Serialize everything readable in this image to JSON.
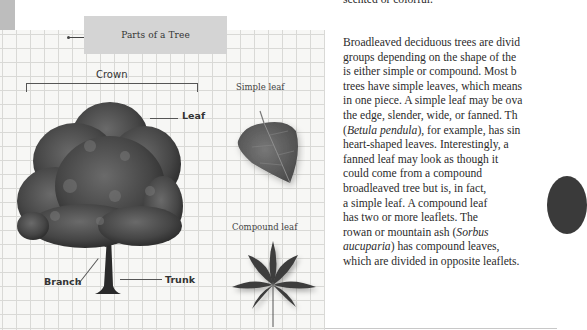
{
  "diagram": {
    "title": "Parts of a Tree",
    "labels": {
      "crown": "Crown",
      "leaf": "Leaf",
      "branch": "Branch",
      "trunk": "Trunk",
      "simple_leaf": "Simple leaf",
      "compound_leaf": "Compound leaf"
    },
    "icons": {
      "tree": "tree-illustration",
      "simple_leaf": "birch-leaf-image",
      "compound_leaf": "compound-leaf-image"
    }
  },
  "article": {
    "previous_line_fragment": "scented or colorful.",
    "paragraph_lines": [
      [
        {
          "t": "Broadleaved deciduous trees are divid"
        }
      ],
      [
        {
          "t": "groups depending on the shape of the"
        }
      ],
      [
        {
          "t": "is either simple or compound. Most b"
        }
      ],
      [
        {
          "t": "trees have simple leaves, which means"
        }
      ],
      [
        {
          "t": "in one piece. A simple leaf may be ova"
        }
      ],
      [
        {
          "t": "the edge, slender, wide, or fanned. Th"
        }
      ],
      [
        {
          "t": "(",
          "i": false
        },
        {
          "t": "Betula pendula",
          "i": true
        },
        {
          "t": "), for example, has sin",
          "i": false
        }
      ],
      [
        {
          "t": "heart-shaped leaves. Interestingly, a"
        }
      ],
      [
        {
          "t": "fanned leaf may look as though it"
        }
      ],
      [
        {
          "t": "could come from a compound"
        }
      ],
      [
        {
          "t": "broadleaved tree but is, in fact,"
        }
      ],
      [
        {
          "t": "a simple leaf. A compound leaf"
        }
      ],
      [
        {
          "t": "has two or more leaflets. The"
        }
      ],
      [
        {
          "t": "rowan or mountain ash (",
          "i": false
        },
        {
          "t": "Sorbus",
          "i": true
        }
      ],
      [
        {
          "t": "aucuparia",
          "i": true
        },
        {
          "t": ") has compound leaves,",
          "i": false
        }
      ],
      [
        {
          "t": "which are divided in opposite leaflets."
        }
      ]
    ]
  },
  "colors": {
    "grid_line": "#d9d9d6",
    "title_box": "#d4d4d4",
    "text": "#2b2b2b",
    "foliage": "#4a4a4a"
  }
}
